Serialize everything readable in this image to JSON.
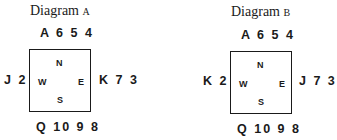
{
  "diagrams": [
    {
      "title_word": "Diagram",
      "title_letter": "A",
      "north": "A 6 5 4",
      "west": "J 2",
      "east": "K 7 3",
      "south": "Q 10 9 8",
      "compass": {
        "n": "N",
        "w": "W",
        "e": "E",
        "s": "S"
      }
    },
    {
      "title_word": "Diagram",
      "title_letter": "B",
      "north": "A 6 5 4",
      "west": "K 2",
      "east": "J 7 3",
      "south": "Q 10 9 8",
      "compass": {
        "n": "N",
        "w": "W",
        "e": "E",
        "s": "S"
      }
    }
  ]
}
